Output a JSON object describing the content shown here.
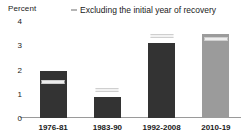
{
  "chart_data": {
    "type": "bar",
    "title": "",
    "subtitle": "",
    "xlabel": "",
    "ylabel": "Percent",
    "ylim": [
      0,
      4
    ],
    "yticks": [
      0,
      1,
      2,
      3,
      4
    ],
    "ytick_labels": [
      "0",
      "1",
      "2",
      "3",
      "4"
    ],
    "grid": false,
    "categories": [
      "1976-81",
      "1983-90",
      "1992-2008",
      "2010-19"
    ],
    "series": [
      {
        "name": "Average growth",
        "values": [
          1.93,
          0.87,
          3.1,
          3.45
        ],
        "colors": [
          "#333333",
          "#333333",
          "#333333",
          "#9b9b9b"
        ]
      },
      {
        "name": "Excluding the initial year of recovery",
        "type": "marker",
        "values": [
          1.5,
          1.15,
          3.4,
          3.25
        ],
        "marker": "horizontal-dash"
      }
    ],
    "legend": {
      "position": "top-center",
      "entries": [
        {
          "label": "Excluding the initial year of recovery",
          "marker": "horizontal-dash",
          "color": "#b5b5b5"
        }
      ]
    },
    "annotations": []
  },
  "axis": {
    "unit_label": "Percent"
  },
  "colors": {
    "bar_dark": "#333333",
    "bar_light": "#9b9b9b",
    "marker": "#f2f2f2",
    "axis_line": "#9a9a9a",
    "text": "#1a1a1a"
  }
}
